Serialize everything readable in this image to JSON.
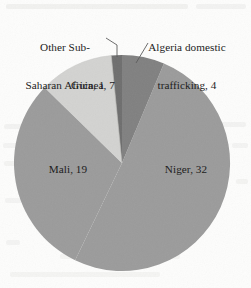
{
  "chart_data": {
    "type": "pie",
    "title": "",
    "subtitle": "",
    "xlabel": "",
    "ylabel": "",
    "legend_position": "none",
    "grid": false,
    "total": 63,
    "units": "count",
    "start_angle_deg": 0,
    "direction": "clockwise",
    "categories": [
      "Algeria domestic trafficking",
      "Niger",
      "Mali",
      "Guinea",
      "Other Sub-Saharan Africa"
    ],
    "values": [
      4,
      32,
      19,
      7,
      1
    ],
    "slices": [
      {
        "name": "algeria-domestic-trafficking",
        "label": "Algeria domestic\ntrafficking, 4",
        "category": "Algeria domestic trafficking",
        "value": 4,
        "color": "#808080",
        "start_deg": 0,
        "end_deg": 22.857,
        "percent": 6.3
      },
      {
        "name": "niger",
        "label": "Niger, 32",
        "category": "Niger",
        "value": 32,
        "color": "#9b9b9b",
        "start_deg": 22.857,
        "end_deg": 205.714,
        "percent": 50.8
      },
      {
        "name": "mali",
        "label": "Mali, 19",
        "category": "Mali",
        "value": 19,
        "color": "#9b9b9b",
        "start_deg": 205.714,
        "end_deg": 314.286,
        "percent": 30.2
      },
      {
        "name": "guinea",
        "label": "Guinea, 7",
        "category": "Guinea",
        "value": 7,
        "color": "#d3d3d1",
        "start_deg": 314.286,
        "end_deg": 354.286,
        "percent": 11.1
      },
      {
        "name": "other-sub-saharan-africa",
        "label": "Other Sub-\nSaharan Africa, 1",
        "category": "Other Sub-Saharan Africa",
        "value": 1,
        "color": "#6e6e6e",
        "start_deg": 354.286,
        "end_deg": 360,
        "percent": 1.6
      }
    ]
  },
  "labels": {
    "other_line1": "Other Sub-",
    "other_line2": "Saharan Africa, 1",
    "algeria_line1": "Algeria domestic",
    "algeria_line2": "trafficking, 4",
    "guinea": "Guinea, 7",
    "mali": "Mali, 19",
    "niger": "Niger, 32"
  },
  "colors": {
    "background": "#fdfdfc",
    "text": "#1d1d1d",
    "leader_line": "#5a5a5a",
    "slice_niger": "#9b9b9b",
    "slice_mali": "#9b9b9b",
    "slice_guinea": "#d3d3d1",
    "slice_algeria": "#808080",
    "slice_other": "#6e6e6e"
  },
  "geometry": {
    "center_x": 122,
    "center_y": 163,
    "radius": 108
  }
}
